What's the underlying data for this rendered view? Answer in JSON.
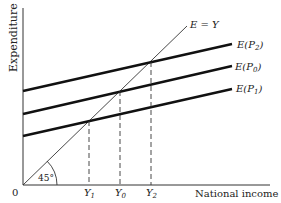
{
  "diagram": {
    "type": "keynesian-cross",
    "y_axis_label": "Expenditure",
    "x_axis_label": "National income",
    "origin_label": "0",
    "angle_label": "45°",
    "diagonal_label": "E = Y",
    "curves": [
      {
        "label": "E(P",
        "sub": "2",
        "close": ")"
      },
      {
        "label": "E(P",
        "sub": "0",
        "close": ")"
      },
      {
        "label": "E(P",
        "sub": "1",
        "close": ")"
      }
    ],
    "x_ticks": [
      {
        "label": "Y",
        "sub": "1"
      },
      {
        "label": "Y",
        "sub": "0"
      },
      {
        "label": "Y",
        "sub": "2"
      }
    ]
  }
}
